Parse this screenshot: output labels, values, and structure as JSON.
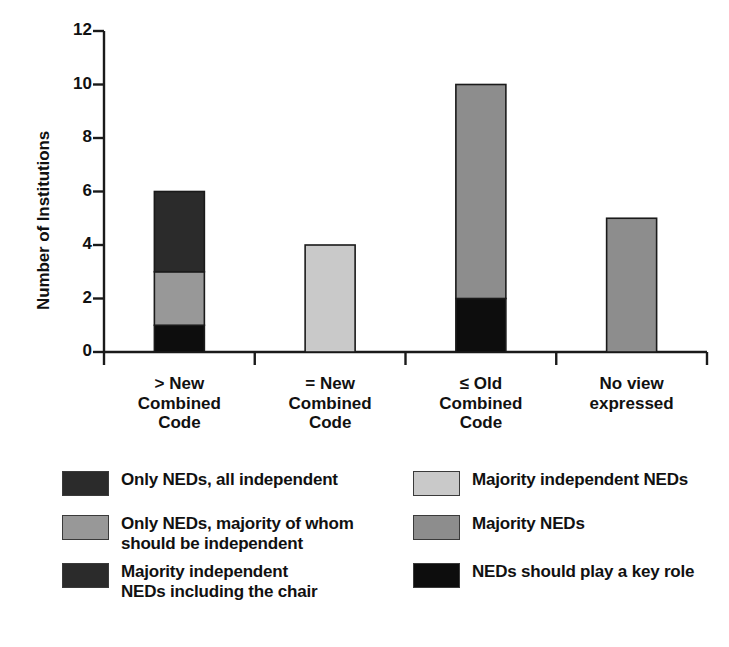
{
  "chart_data": {
    "type": "bar",
    "subtype": "stacked-bar",
    "title": "",
    "xlabel": "",
    "ylabel": "Number of Institutions",
    "ylim": [
      0,
      12
    ],
    "ytick_values": [
      0,
      2,
      4,
      6,
      8,
      10,
      12
    ],
    "ytick_labels": [
      "0",
      "2",
      "4",
      "6",
      "8",
      "10",
      "12"
    ],
    "grid": false,
    "legend_position": "below",
    "categories": [
      "> New\nCombined\nCode",
      "= New\nCombined\nCode",
      "≤ Old\nCombined\nCode",
      "No view\nexpressed"
    ],
    "series": [
      {
        "name": "NEDs should play a key role",
        "color": "#0d0d0d",
        "values": [
          1,
          0,
          2,
          0
        ]
      },
      {
        "name": "Only NEDs, majority of whom should be independent",
        "color": "#989898",
        "values": [
          2,
          0,
          0,
          0
        ]
      },
      {
        "name": "Only NEDs, all independent",
        "color": "#2b2b2b",
        "values": [
          3,
          0,
          0,
          0
        ]
      },
      {
        "name": "Majority independent NEDs",
        "color": "#c9c9c9",
        "values": [
          0,
          4,
          0,
          0
        ]
      },
      {
        "name": "Majority NEDs",
        "color": "#8d8d8d",
        "values": [
          0,
          0,
          8,
          5
        ]
      },
      {
        "name": "Majority independent NEDs including the chair",
        "color": "#2b2b2b",
        "values": [
          0,
          0,
          0,
          0
        ]
      }
    ],
    "totals": [
      6,
      4,
      10,
      5
    ]
  },
  "legend": {
    "items": [
      {
        "label": "Only NEDs, all independent",
        "color": "#2b2b2b"
      },
      {
        "label": "Majority independent NEDs",
        "color": "#c9c9c9"
      },
      {
        "label": "Only NEDs, majority of whom\nshould be independent",
        "color": "#989898"
      },
      {
        "label": "Majority NEDs",
        "color": "#8d8d8d"
      },
      {
        "label": "Majority independent\nNEDs including the chair",
        "color": "#2b2b2b"
      },
      {
        "label": "NEDs should play a key role",
        "color": "#0d0d0d"
      }
    ]
  },
  "axis": {
    "y_title": "Number of Institutions"
  },
  "colors": {
    "axis": "#1a1a1a",
    "text": "#111111",
    "background": "#ffffff"
  }
}
